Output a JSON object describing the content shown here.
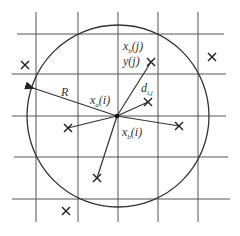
{
  "diagram": {
    "grid": {
      "vertical_x": [
        36,
        78,
        118,
        158,
        198
      ],
      "horizontal_y": [
        34,
        74,
        116,
        157,
        199
      ],
      "x_extent": [
        12,
        232
      ],
      "y_extent": [
        12,
        222
      ]
    },
    "circle": {
      "cx": 118,
      "cy": 116,
      "r": 91
    },
    "center_point": {
      "x": 117,
      "y": 116
    },
    "labels": {
      "R": "R",
      "xa_i": "x",
      "xa_i_sub": "a",
      "xa_i_arg": "(i)",
      "xb_j": "x",
      "xb_j_sub": "b",
      "xb_j_arg": "(j)",
      "y_j": "y(j)",
      "d_ij": "d",
      "d_ij_sub": "i,j",
      "xb_i": "x",
      "xb_i_sub": "b",
      "xb_i_arg": "(i)"
    },
    "markers": [
      {
        "x": 25,
        "y": 65
      },
      {
        "x": 212,
        "y": 57
      },
      {
        "x": 151,
        "y": 62
      },
      {
        "x": 148,
        "y": 102
      },
      {
        "x": 68,
        "y": 128
      },
      {
        "x": 179,
        "y": 126
      },
      {
        "x": 97,
        "y": 178
      },
      {
        "x": 66,
        "y": 211
      }
    ]
  }
}
